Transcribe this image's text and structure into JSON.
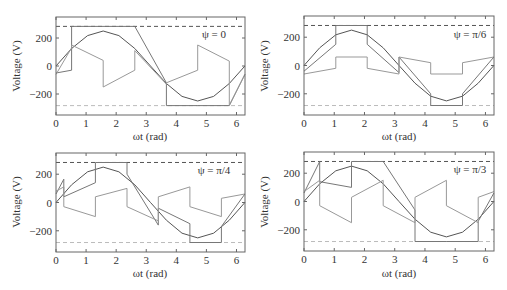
{
  "chart_data": [
    {
      "type": "line",
      "panel_label": "ψ = 0",
      "psi_rad": 0,
      "xlabel": "ωt (rad)",
      "ylabel": "Voltage (V)",
      "xlim": [
        0,
        6.283
      ],
      "ylim": [
        -350,
        350
      ],
      "xticks": [
        0,
        1,
        2,
        3,
        4,
        5,
        6
      ],
      "yticks": [
        200,
        0,
        -200
      ],
      "grid": false,
      "reference_lines": [
        {
          "name": "upper limit",
          "y": 283,
          "style": "dashed",
          "color": "#555555"
        },
        {
          "name": "lower limit",
          "y": -283,
          "style": "dashed",
          "color": "#bbbbbb"
        }
      ],
      "series": [
        {
          "name": "reference sine",
          "color": "#555555",
          "x": [
            0,
            0.52,
            1.05,
            1.57,
            2.09,
            2.62,
            3.14,
            3.67,
            4.19,
            4.71,
            5.24,
            5.76,
            6.28
          ],
          "y": [
            0,
            125,
            217,
            250,
            217,
            125,
            0,
            -125,
            -217,
            -250,
            -217,
            -125,
            0
          ]
        },
        {
          "name": "switched output",
          "color": "#777777",
          "x": [
            0,
            0.52,
            0.52,
            2.62,
            2.62,
            3.67,
            3.67,
            4.71,
            4.71,
            5.76,
            5.76,
            6.28
          ],
          "y": [
            -50,
            -30,
            283,
            283,
            283,
            -120,
            -283,
            -283,
            -283,
            -283,
            -283,
            -60
          ]
        },
        {
          "name": "filtered output",
          "color": "#999999",
          "x": [
            0,
            0.52,
            0.52,
            1.57,
            1.57,
            2.62,
            2.62,
            3.67,
            3.67,
            4.71,
            4.71,
            5.76,
            5.76,
            6.28
          ],
          "y": [
            -60,
            130,
            150,
            40,
            -150,
            -30,
            110,
            -130,
            -120,
            -30,
            150,
            35,
            -280,
            -60
          ]
        }
      ]
    },
    {
      "type": "line",
      "panel_label": "ψ = π/6",
      "psi_rad": 0.5236,
      "xlabel": "ωt (rad)",
      "ylabel": "Voltage (V)",
      "xlim": [
        0,
        6.283
      ],
      "ylim": [
        -350,
        350
      ],
      "xticks": [
        0,
        1,
        2,
        3,
        4,
        5,
        6
      ],
      "yticks": [
        200,
        0,
        -200
      ],
      "grid": false,
      "reference_lines": [
        {
          "name": "upper limit",
          "y": 283,
          "style": "dashed",
          "color": "#555555"
        },
        {
          "name": "lower limit",
          "y": -283,
          "style": "dashed",
          "color": "#bbbbbb"
        }
      ],
      "series": [
        {
          "name": "reference sine",
          "color": "#555555",
          "x": [
            0,
            0.52,
            1.05,
            1.57,
            2.09,
            2.62,
            3.14,
            3.67,
            4.19,
            4.71,
            5.24,
            5.76,
            6.28
          ],
          "y": [
            0,
            125,
            217,
            250,
            217,
            125,
            0,
            -125,
            -217,
            -250,
            -217,
            -125,
            0
          ]
        },
        {
          "name": "switched output",
          "color": "#777777",
          "x": [
            0,
            1.05,
            1.05,
            2.09,
            2.09,
            3.14,
            3.14,
            4.19,
            4.19,
            5.24,
            5.24,
            6.28
          ],
          "y": [
            -40,
            150,
            283,
            283,
            150,
            -50,
            60,
            -200,
            -283,
            -283,
            -200,
            60
          ]
        },
        {
          "name": "filtered output",
          "color": "#999999",
          "x": [
            0,
            1.05,
            1.05,
            2.09,
            2.09,
            3.14,
            3.14,
            4.19,
            4.19,
            5.24,
            5.24,
            6.28
          ],
          "y": [
            -60,
            -20,
            60,
            60,
            -20,
            -60,
            60,
            20,
            -60,
            -60,
            20,
            60
          ]
        }
      ]
    },
    {
      "type": "line",
      "panel_label": "ψ = π/4",
      "psi_rad": 0.7854,
      "xlabel": "ωt (rad)",
      "ylabel": "Voltage (V)",
      "xlim": [
        0,
        6.283
      ],
      "ylim": [
        -350,
        350
      ],
      "xticks": [
        0,
        1,
        2,
        3,
        4,
        5,
        6
      ],
      "yticks": [
        200,
        0,
        -200
      ],
      "grid": false,
      "reference_lines": [
        {
          "name": "upper limit",
          "y": 283,
          "style": "dashed",
          "color": "#555555"
        },
        {
          "name": "lower limit",
          "y": -283,
          "style": "dashed",
          "color": "#bbbbbb"
        }
      ],
      "series": [
        {
          "name": "reference sine",
          "color": "#555555",
          "x": [
            0,
            0.52,
            1.05,
            1.57,
            2.09,
            2.62,
            3.14,
            3.67,
            4.19,
            4.71,
            5.24,
            5.76,
            6.28
          ],
          "y": [
            0,
            125,
            217,
            250,
            217,
            125,
            0,
            -125,
            -217,
            -250,
            -217,
            -125,
            0
          ]
        },
        {
          "name": "switched output",
          "color": "#777777",
          "x": [
            0,
            0.26,
            0.26,
            1.31,
            1.31,
            2.36,
            2.36,
            3.4,
            3.4,
            4.45,
            4.45,
            5.5,
            5.5,
            6.28
          ],
          "y": [
            60,
            165,
            40,
            140,
            283,
            283,
            200,
            -160,
            -40,
            -150,
            -283,
            -283,
            -170,
            60
          ]
        },
        {
          "name": "filtered output",
          "color": "#999999",
          "x": [
            0,
            0.26,
            0.26,
            1.31,
            1.31,
            2.36,
            2.36,
            3.4,
            3.4,
            4.45,
            4.45,
            5.5,
            5.5,
            6.28
          ],
          "y": [
            80,
            110,
            -30,
            -100,
            40,
            100,
            -30,
            -130,
            40,
            110,
            -30,
            -100,
            30,
            60
          ]
        }
      ]
    },
    {
      "type": "line",
      "panel_label": "ψ = π/3",
      "psi_rad": 1.0472,
      "xlabel": "ωt (rad)",
      "ylabel": "Voltage (V)",
      "xlim": [
        0,
        6.283
      ],
      "ylim": [
        -350,
        350
      ],
      "xticks": [
        0,
        1,
        2,
        3,
        4,
        5,
        6
      ],
      "yticks": [
        200,
        0,
        -200
      ],
      "grid": false,
      "reference_lines": [
        {
          "name": "upper limit",
          "y": 283,
          "style": "dashed",
          "color": "#555555"
        },
        {
          "name": "lower limit",
          "y": -283,
          "style": "dashed",
          "color": "#bbbbbb"
        }
      ],
      "series": [
        {
          "name": "reference sine",
          "color": "#555555",
          "x": [
            0,
            0.52,
            1.05,
            1.57,
            2.09,
            2.62,
            3.14,
            3.67,
            4.19,
            4.71,
            5.24,
            5.76,
            6.28
          ],
          "y": [
            0,
            125,
            217,
            250,
            217,
            125,
            0,
            -125,
            -217,
            -250,
            -217,
            -125,
            0
          ]
        },
        {
          "name": "switched output",
          "color": "#777777",
          "x": [
            0,
            0.52,
            0.52,
            1.57,
            1.57,
            2.62,
            2.62,
            3.67,
            3.67,
            4.71,
            4.71,
            5.76,
            5.76,
            6.28
          ],
          "y": [
            60,
            283,
            140,
            100,
            283,
            283,
            283,
            -60,
            -283,
            -283,
            -283,
            -283,
            -140,
            60
          ]
        },
        {
          "name": "filtered output",
          "color": "#999999",
          "x": [
            0,
            0.52,
            0.52,
            1.57,
            1.57,
            2.62,
            2.62,
            3.67,
            3.67,
            4.71,
            4.71,
            5.76,
            5.76,
            6.28
          ],
          "y": [
            70,
            150,
            -30,
            -150,
            30,
            150,
            -30,
            -150,
            30,
            150,
            -30,
            -150,
            30,
            70
          ]
        }
      ]
    }
  ]
}
